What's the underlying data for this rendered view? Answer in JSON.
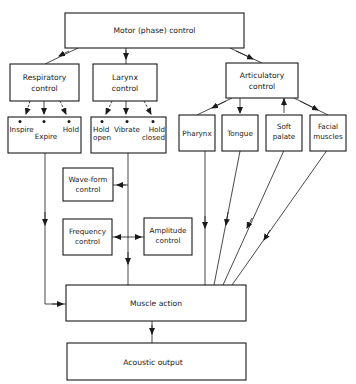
{
  "diagram": {
    "motor": {
      "label": "Motor (phase) control"
    },
    "respiratory": {
      "line1": "Respiratory",
      "line2": "control"
    },
    "larynx": {
      "line1": "Larynx",
      "line2": "control"
    },
    "articulatory": {
      "line1": "Articulatory",
      "line2": "control"
    },
    "respiratory_options": {
      "inspire": "Inspire",
      "expire": "Expire",
      "hold": "Hold"
    },
    "larynx_options": {
      "hold_open_1": "Hold",
      "hold_open_2": "open",
      "vibrate": "Vibrate",
      "hold_closed_1": "Hold",
      "hold_closed_2": "closed"
    },
    "pharynx": {
      "label": "Pharynx"
    },
    "tongue": {
      "label": "Tongue"
    },
    "soft_palate": {
      "line1": "Soft",
      "line2": "palate"
    },
    "facial": {
      "line1": "Facial",
      "line2": "muscles"
    },
    "waveform": {
      "line1": "Wave-form",
      "line2": "control"
    },
    "frequency": {
      "line1": "Frequency",
      "line2": "control"
    },
    "amplitude": {
      "line1": "Amplitude",
      "line2": "control"
    },
    "muscle": {
      "label": "Muscle action"
    },
    "acoustic": {
      "label": "Acoustic output"
    }
  }
}
